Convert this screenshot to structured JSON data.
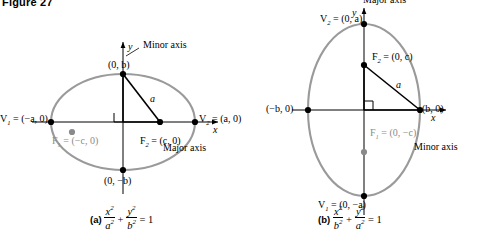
{
  "figure": {
    "title": "Figure 27"
  },
  "panel_a": {
    "name": "horizontal-ellipse",
    "axis_labels": {
      "x": "x",
      "y": "y"
    },
    "annotations": {
      "minor_axis": "Minor axis",
      "major_axis": "Major axis",
      "vertex_left": "V",
      "vertex_left_sub": "1",
      "vertex_left_coords": " = (−a, 0)",
      "vertex_right": "V",
      "vertex_right_sub": "2",
      "vertex_right_coords": " = (a, 0)",
      "focus_left": "F",
      "focus_left_sub": "1",
      "focus_left_coords": " = (−c, 0)",
      "focus_right": "F",
      "focus_right_sub": "2",
      "focus_right_coords": " = (c, 0)",
      "co_vertex_top": "(0, b)",
      "co_vertex_bottom": "(0, −b)",
      "semi_major_label": "a"
    },
    "caption": {
      "tag": "(a)",
      "equation_parts": {
        "n1": "x",
        "d1": "a",
        "n2": "y",
        "d2": "b",
        "rhs": "= 1"
      }
    }
  },
  "panel_b": {
    "name": "vertical-ellipse",
    "axis_labels": {
      "x": "x",
      "y": "y"
    },
    "annotations": {
      "major_axis": "Major axis",
      "minor_axis": "Minor axis",
      "vertex_top": "V",
      "vertex_top_sub": "2",
      "vertex_top_coords": " = (0, a)",
      "vertex_bottom": "V",
      "vertex_bottom_sub": "1",
      "vertex_bottom_coords": " = (0, −a)",
      "focus_top": "F",
      "focus_top_sub": "2",
      "focus_top_coords": " = (0, c)",
      "focus_bottom": "F",
      "focus_bottom_sub": "1",
      "focus_bottom_coords": " = (0, −c)",
      "co_vertex_left": "(−b, 0)",
      "co_vertex_right": "(b, 0)",
      "semi_major_label": "a"
    },
    "caption": {
      "tag": "(b)",
      "equation_parts": {
        "n1": "x",
        "d1": "b",
        "n2": "y",
        "d2": "a",
        "rhs": "= 1"
      }
    }
  },
  "colors": {
    "curve": "#9a9a9a",
    "axis": "#000000",
    "gray_text": "#8a8a8a",
    "gray_dot": "#8a8a8a",
    "black_dot": "#000000"
  }
}
